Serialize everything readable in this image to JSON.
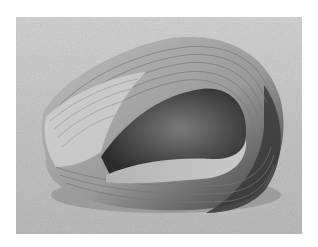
{
  "image": {
    "subject": "curled banded object on textured surface",
    "palette": {
      "border": "#ffffff",
      "background_light": "#d9d9d9",
      "background_mid": "#b8b8b8",
      "object_light": "#c8c8c8",
      "object_mid": "#8f8f8f",
      "object_dark": "#3a3a3a",
      "shadow": "#222222"
    }
  }
}
